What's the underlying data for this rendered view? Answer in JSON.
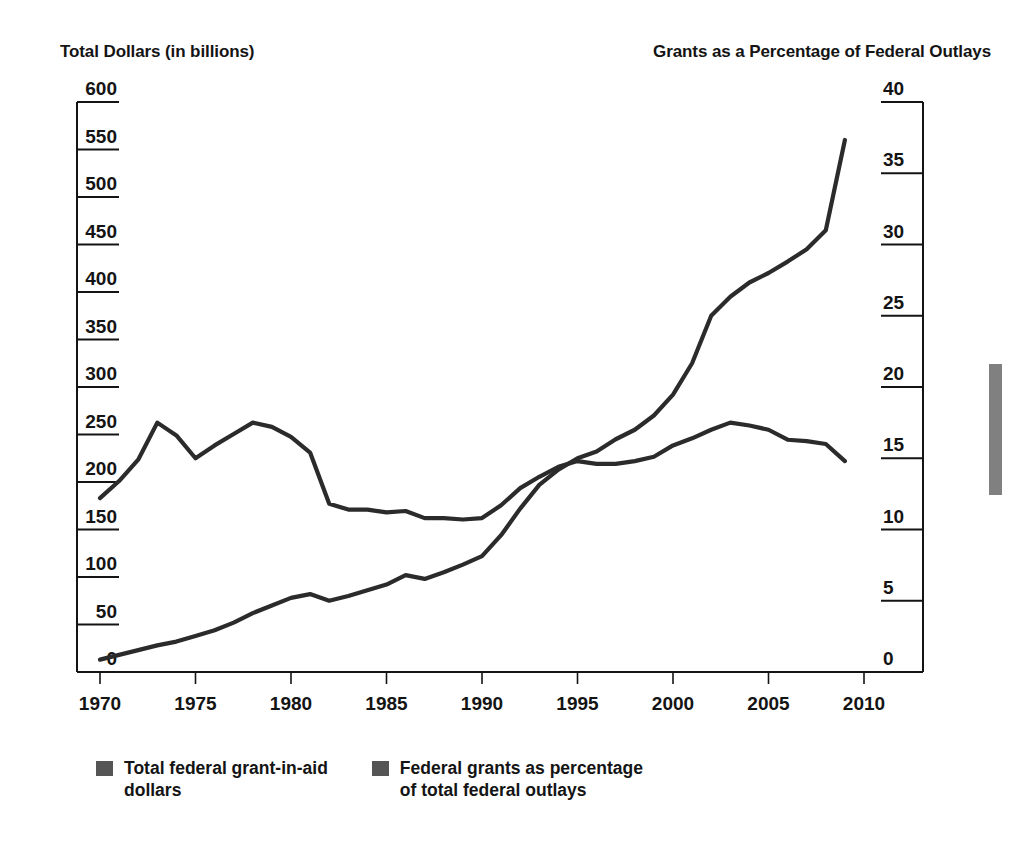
{
  "axis_captions": {
    "left": "Total Dollars (in billions)",
    "right": "Grants as a Percentage of Federal Outlays"
  },
  "legend": {
    "items": [
      {
        "label": "Total federal grant-in-aid\ndollars",
        "color": "#555555"
      },
      {
        "label": "Federal grants as percentage\nof total federal outlays",
        "color": "#555555"
      }
    ]
  },
  "colors": {
    "line": "#2b2b2b",
    "axis": "#141414",
    "legend_swatch": "#555555",
    "edge_bar": "#808080"
  },
  "chart_data": {
    "type": "line",
    "title": "",
    "xlabel": "",
    "ylabel": "Total Dollars (in billions)",
    "y2label": "Grants as a Percentage of Federal Outlays",
    "xlim": [
      1968,
      2011
    ],
    "ylim": [
      0,
      600
    ],
    "y2lim": [
      0,
      40
    ],
    "grid": false,
    "legend_position": "bottom-left",
    "xticks": [
      1970,
      1975,
      1980,
      1985,
      1990,
      1995,
      2000,
      2005,
      2010
    ],
    "yticks": [
      0,
      50,
      100,
      150,
      200,
      250,
      300,
      350,
      400,
      450,
      500,
      550,
      600
    ],
    "y2ticks": [
      0,
      5,
      10,
      15,
      20,
      25,
      30,
      35,
      40
    ],
    "x": [
      1970,
      1971,
      1972,
      1973,
      1974,
      1975,
      1976,
      1977,
      1978,
      1979,
      1980,
      1981,
      1982,
      1983,
      1984,
      1985,
      1986,
      1987,
      1988,
      1989,
      1990,
      1991,
      1992,
      1993,
      1994,
      1995,
      1996,
      1997,
      1998,
      1999,
      2000,
      2001,
      2002,
      2003,
      2004,
      2005,
      2006,
      2007,
      2008,
      2009
    ],
    "series": [
      {
        "name": "Total federal grant-in-aid dollars",
        "axis": "left",
        "unit": "billions of dollars",
        "values": [
          13,
          18,
          23,
          28,
          32,
          38,
          44,
          52,
          62,
          70,
          78,
          82,
          75,
          80,
          86,
          92,
          102,
          98,
          105,
          113,
          122,
          144,
          172,
          197,
          213,
          225,
          232,
          245,
          255,
          270,
          292,
          325,
          375,
          395,
          410,
          420,
          432,
          445,
          465,
          560
        ]
      },
      {
        "name": "Federal grants as percentage of total federal outlays",
        "axis": "right",
        "unit": "percent",
        "values": [
          12.2,
          13.4,
          14.9,
          17.5,
          16.6,
          15.0,
          15.9,
          16.7,
          17.5,
          17.2,
          16.5,
          15.4,
          11.8,
          11.4,
          11.4,
          11.2,
          11.3,
          10.8,
          10.8,
          10.7,
          10.8,
          11.7,
          12.9,
          13.7,
          14.4,
          14.8,
          14.6,
          14.6,
          14.8,
          15.1,
          15.9,
          16.4,
          17.0,
          17.5,
          17.3,
          17.0,
          16.3,
          16.2,
          16.0,
          14.8
        ]
      }
    ]
  }
}
